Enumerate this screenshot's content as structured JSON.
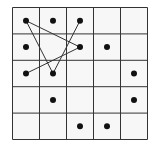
{
  "grid": {
    "cols": 5,
    "rows": 5,
    "origin_x": 12.5,
    "origin_y": 7.5,
    "cell_w": 27,
    "cell_h": 26.4,
    "line_color": "#333333",
    "cell_fill": "#f7f7f7"
  },
  "dots": [
    {
      "col": 0,
      "row": 0
    },
    {
      "col": 1,
      "row": 0
    },
    {
      "col": 2,
      "row": 0
    },
    {
      "col": 0,
      "row": 1
    },
    {
      "col": 2,
      "row": 1
    },
    {
      "col": 3,
      "row": 1
    },
    {
      "col": 0,
      "row": 2
    },
    {
      "col": 1,
      "row": 2
    },
    {
      "col": 4,
      "row": 2
    },
    {
      "col": 1,
      "row": 3
    },
    {
      "col": 4,
      "row": 3
    },
    {
      "col": 2,
      "row": 4
    },
    {
      "col": 3,
      "row": 4
    }
  ],
  "dot_color": "#111111",
  "dot_radius": 3,
  "segments": [
    {
      "from": {
        "col": 0,
        "row": 0
      },
      "to": {
        "col": 2,
        "row": 1
      }
    },
    {
      "from": {
        "col": 0,
        "row": 0
      },
      "to": {
        "col": 1,
        "row": 2
      }
    },
    {
      "from": {
        "col": 2,
        "row": 0
      },
      "to": {
        "col": 1,
        "row": 2
      }
    },
    {
      "from": {
        "col": 0,
        "row": 2
      },
      "to": {
        "col": 2,
        "row": 1
      }
    }
  ],
  "segment_color": "#333333"
}
